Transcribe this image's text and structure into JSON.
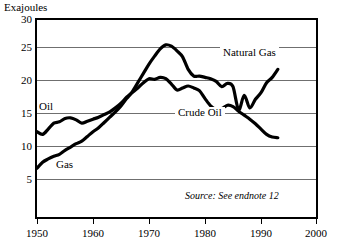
{
  "chart_data": {
    "type": "line",
    "title": "",
    "ylabel": "Exajoules",
    "xlabel": "",
    "xlim": [
      1950,
      2000
    ],
    "ylim": [
      0,
      30
    ],
    "yticks": [
      5,
      10,
      15,
      20,
      25,
      30
    ],
    "xticks": [
      1950,
      1960,
      1970,
      1980,
      1990,
      2000
    ],
    "grid": true,
    "legend_position": "inline-annotations",
    "annotations": [
      {
        "text": "Oil",
        "x": 1953.5,
        "y": 16.2
      },
      {
        "text": "Gas",
        "x": 1955.5,
        "y": 8.8
      },
      {
        "text": "Natural Gas",
        "x": 1988.0,
        "y": 24.0
      },
      {
        "text": "Crude Oil",
        "x": 1989.0,
        "y": 14.4
      }
    ],
    "source_note": "Source: See endnote 12",
    "series": [
      {
        "name": "Crude Oil",
        "color": "#000000",
        "x": [
          1950,
          1951,
          1952,
          1953,
          1954,
          1955,
          1956,
          1957,
          1958,
          1959,
          1960,
          1961,
          1962,
          1963,
          1964,
          1965,
          1966,
          1967,
          1968,
          1969,
          1970,
          1971,
          1972,
          1973,
          1974,
          1975,
          1976,
          1977,
          1978,
          1979,
          1980,
          1981,
          1982,
          1983,
          1984,
          1985,
          1986,
          1987,
          1988,
          1989,
          1990,
          1991,
          1992,
          1993
        ],
        "values": [
          13.0,
          12.6,
          13.4,
          14.3,
          14.5,
          15.0,
          15.1,
          14.8,
          14.3,
          14.6,
          14.9,
          15.2,
          15.6,
          16.0,
          16.6,
          17.3,
          18.2,
          18.9,
          19.6,
          20.4,
          21.0,
          20.9,
          21.2,
          21.0,
          20.2,
          19.3,
          19.6,
          19.9,
          19.6,
          19.2,
          18.0,
          16.9,
          16.4,
          16.5,
          17.0,
          16.8,
          16.1,
          15.5,
          14.9,
          14.2,
          13.4,
          12.6,
          12.2,
          12.1
        ]
      },
      {
        "name": "Natural Gas",
        "color": "#000000",
        "x": [
          1950,
          1951,
          1952,
          1953,
          1954,
          1955,
          1956,
          1957,
          1958,
          1959,
          1960,
          1961,
          1962,
          1963,
          1964,
          1965,
          1966,
          1967,
          1968,
          1969,
          1970,
          1971,
          1972,
          1973,
          1974,
          1975,
          1976,
          1977,
          1978,
          1979,
          1980,
          1981,
          1982,
          1983,
          1984,
          1985,
          1986,
          1987,
          1988,
          1989,
          1990,
          1991,
          1992,
          1993
        ],
        "values": [
          7.5,
          8.4,
          8.9,
          9.3,
          9.6,
          10.2,
          10.7,
          11.2,
          11.6,
          12.3,
          13.0,
          13.6,
          14.4,
          15.2,
          16.0,
          16.9,
          18.0,
          19.0,
          20.4,
          21.8,
          23.2,
          24.4,
          25.5,
          26.1,
          25.9,
          25.2,
          24.3,
          22.4,
          21.4,
          21.4,
          21.2,
          21.0,
          20.6,
          19.8,
          20.3,
          19.8,
          16.3,
          18.5,
          16.6,
          17.9,
          18.9,
          20.4,
          21.2,
          22.4
        ]
      }
    ]
  },
  "ytick_labels": [
    "30",
    "25",
    "20",
    "15",
    "10",
    "5"
  ],
  "xtick_labels": [
    "1950",
    "1960",
    "1970",
    "1980",
    "1990",
    "2000"
  ],
  "labels": {
    "y_axis_title": "Exajoules",
    "oil": "Oil",
    "gas": "Gas",
    "natural_gas": "Natural Gas",
    "crude_oil": "Crude Oil",
    "source": "Source: See endnote 12"
  }
}
